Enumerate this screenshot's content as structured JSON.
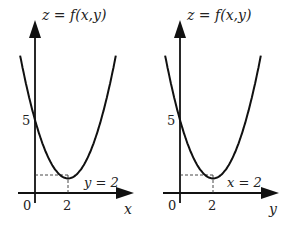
{
  "figure": {
    "panels": [
      {
        "id": "left",
        "title": "z = f(x,y)",
        "vertical_axis": "z",
        "horizontal_axis": "x",
        "origin_label": "0",
        "tick_label": "2",
        "intercept_label": "5",
        "slice_label": "y = 2",
        "curve": {
          "z_intercept": 5,
          "min_at": 2,
          "min_value": 1
        }
      },
      {
        "id": "right",
        "title": "z = f(x,y)",
        "vertical_axis": "z",
        "horizontal_axis": "y",
        "origin_label": "0",
        "tick_label": "2",
        "intercept_label": "5",
        "slice_label": "x = 2",
        "curve": {
          "z_intercept": 5,
          "min_at": 2,
          "min_value": 1
        }
      }
    ]
  }
}
